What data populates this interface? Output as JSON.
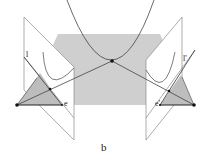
{
  "figure": {
    "caption": "b",
    "labels": {
      "left_line": "l",
      "left_epipole": "e",
      "right_line": "l'",
      "right_epipole": "e'"
    },
    "colors": {
      "plane_fill": "#cfcfcf",
      "line": "#555555",
      "light_line": "#9a9a9a",
      "point": "#111111",
      "background": "#ffffff"
    }
  }
}
